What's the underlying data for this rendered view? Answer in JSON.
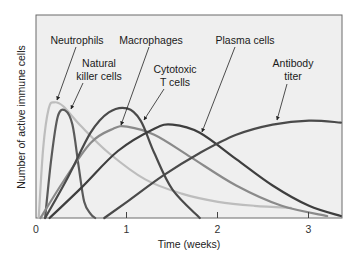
{
  "chart_data": {
    "type": "line",
    "title": "",
    "xlabel": "Time (weeks)",
    "ylabel": "Number of active immune cells",
    "xlim": [
      0,
      3.35
    ],
    "ylim": [
      0,
      1
    ],
    "xticks": [
      0,
      1,
      2,
      3
    ],
    "xtick_labels": [
      "0",
      "1",
      "2",
      "3"
    ],
    "yticks": [],
    "grid": false,
    "legend": "inline annotations with arrows",
    "series": [
      {
        "name": "Neutrophils",
        "color": "#bdbdbd",
        "x": [
          0.03,
          0.08,
          0.14,
          0.2,
          0.3,
          0.5,
          0.8,
          1.2,
          1.6,
          2.0,
          2.4,
          2.8
        ],
        "values": [
          0.0,
          0.35,
          0.54,
          0.57,
          0.55,
          0.45,
          0.32,
          0.19,
          0.12,
          0.08,
          0.06,
          0.05
        ]
      },
      {
        "name": "Natural killer cells",
        "color": "#5a5a5a",
        "x": [
          0.1,
          0.17,
          0.24,
          0.32,
          0.4,
          0.47,
          0.53,
          0.6,
          0.65
        ],
        "values": [
          0.0,
          0.3,
          0.5,
          0.53,
          0.46,
          0.25,
          0.08,
          0.02,
          0.0
        ]
      },
      {
        "name": "Macrophages",
        "color": "#8a8a8a",
        "x": [
          0.05,
          0.3,
          0.6,
          0.85,
          1.0,
          1.3,
          1.7,
          2.2,
          2.7,
          3.2
        ],
        "values": [
          0.0,
          0.18,
          0.37,
          0.44,
          0.45,
          0.41,
          0.3,
          0.16,
          0.06,
          0.01
        ]
      },
      {
        "name": "Cytotoxic T cells",
        "color": "#4a4a4a",
        "x": [
          0.1,
          0.35,
          0.6,
          0.8,
          1.0,
          1.15,
          1.3,
          1.5,
          1.8
        ],
        "values": [
          0.0,
          0.2,
          0.42,
          0.52,
          0.54,
          0.48,
          0.32,
          0.14,
          0.0
        ]
      },
      {
        "name": "Plasma cells",
        "color": "#3e3e3e",
        "x": [
          0.15,
          0.5,
          0.9,
          1.3,
          1.5,
          1.8,
          2.2,
          2.6,
          3.0,
          3.35
        ],
        "values": [
          0.0,
          0.15,
          0.33,
          0.44,
          0.46,
          0.42,
          0.29,
          0.16,
          0.06,
          0.01
        ]
      },
      {
        "name": "Antibody titer",
        "color": "#4a4a4a",
        "x": [
          0.75,
          1.0,
          1.4,
          1.8,
          2.2,
          2.6,
          3.0,
          3.35
        ],
        "values": [
          0.0,
          0.08,
          0.21,
          0.32,
          0.41,
          0.46,
          0.48,
          0.47
        ]
      }
    ],
    "annotations": [
      {
        "text": [
          "Neutrophils"
        ],
        "target": "Neutrophils"
      },
      {
        "text": [
          "Natural",
          "killer cells"
        ],
        "target": "Natural killer cells"
      },
      {
        "text": [
          "Macrophages"
        ],
        "target": "Macrophages"
      },
      {
        "text": [
          "Cytotoxic",
          "T cells"
        ],
        "target": "Cytotoxic T cells"
      },
      {
        "text": [
          "Plasma cells"
        ],
        "target": "Plasma cells"
      },
      {
        "text": [
          "Antibody",
          "titer"
        ],
        "target": "Antibody titer"
      }
    ]
  },
  "labels": {
    "neutrophils": "Neutrophils",
    "nk_line1": "Natural",
    "nk_line2": "killer cells",
    "macrophages": "Macrophages",
    "ctl_line1": "Cytotoxic",
    "ctl_line2": "T cells",
    "plasma": "Plasma cells",
    "ab_line1": "Antibody",
    "ab_line2": "titer",
    "xlabel": "Time (weeks)",
    "ylabel": "Number of active immune cells",
    "tick0": "0",
    "tick1": "1",
    "tick2": "2",
    "tick3": "3"
  },
  "colors": {
    "plot_bg": "#efefef",
    "frame": "#5a5a5a"
  }
}
